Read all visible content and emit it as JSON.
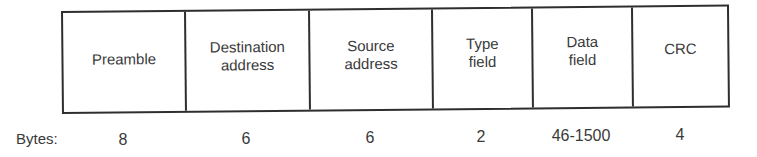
{
  "diagram": {
    "title": "",
    "type": "frame-format",
    "fields": [
      {
        "label": "Preamble",
        "bytes": "8"
      },
      {
        "label": "Destination\naddress",
        "bytes": "6"
      },
      {
        "label": "Source\naddress",
        "bytes": "6"
      },
      {
        "label": "Type\nfield",
        "bytes": "2"
      },
      {
        "label": "Data\nfield",
        "bytes": "46-1500"
      },
      {
        "label": "CRC",
        "bytes": "4"
      }
    ],
    "bytes_label": "Bytes:"
  }
}
